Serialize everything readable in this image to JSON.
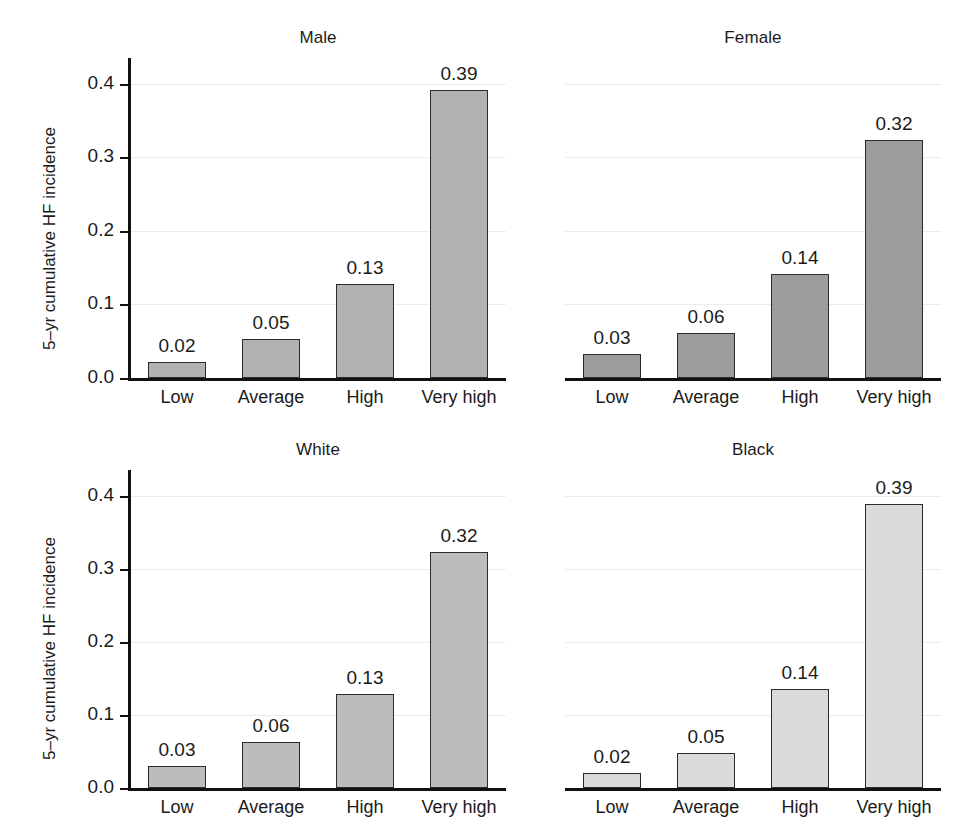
{
  "figure": {
    "width": 979,
    "height": 830,
    "background": "#ffffff",
    "grid_color": "#ececec",
    "axis_color": "#111111",
    "bar_edge_color": "#2b2b2b"
  },
  "chart_data": [
    {
      "type": "bar",
      "title": "Male",
      "panel": "top-left",
      "categories": [
        "Low",
        "Average",
        "High",
        "Very high"
      ],
      "values": [
        0.02,
        0.05,
        0.13,
        0.39
      ],
      "value_labels": [
        "0.02",
        "0.05",
        "0.13",
        "0.39"
      ],
      "bar_values_precise": [
        0.022,
        0.053,
        0.128,
        0.392
      ],
      "xlabel": "",
      "ylabel": "5–yr cumulative HF incidence",
      "ylim": [
        0.0,
        0.435
      ],
      "yticks": [
        0.0,
        0.1,
        0.2,
        0.3,
        0.4
      ],
      "ytick_labels": [
        "0.0",
        "0.1",
        "0.2",
        "0.3",
        "0.4"
      ],
      "grid": true,
      "legend": "none",
      "bar_color": "#b2b2b2",
      "show_yaxis": true
    },
    {
      "type": "bar",
      "title": "Female",
      "panel": "top-right",
      "categories": [
        "Low",
        "Average",
        "High",
        "Very high"
      ],
      "values": [
        0.03,
        0.06,
        0.14,
        0.32
      ],
      "value_labels": [
        "0.03",
        "0.06",
        "0.14",
        "0.32"
      ],
      "bar_values_precise": [
        0.033,
        0.061,
        0.141,
        0.323
      ],
      "xlabel": "",
      "ylabel": "",
      "ylim": [
        0.0,
        0.435
      ],
      "yticks": [
        0.0,
        0.1,
        0.2,
        0.3,
        0.4
      ],
      "ytick_labels": [],
      "grid": true,
      "legend": "none",
      "bar_color": "#9c9c9c",
      "show_yaxis": false
    },
    {
      "type": "bar",
      "title": "White",
      "panel": "bottom-left",
      "categories": [
        "Low",
        "Average",
        "High",
        "Very high"
      ],
      "values": [
        0.03,
        0.06,
        0.13,
        0.32
      ],
      "value_labels": [
        "0.03",
        "0.06",
        "0.13",
        "0.32"
      ],
      "bar_values_precise": [
        0.03,
        0.063,
        0.128,
        0.323
      ],
      "xlabel": "",
      "ylabel": "5–yr cumulative HF incidence",
      "ylim": [
        0.0,
        0.435
      ],
      "yticks": [
        0.0,
        0.1,
        0.2,
        0.3,
        0.4
      ],
      "ytick_labels": [
        "0.0",
        "0.1",
        "0.2",
        "0.3",
        "0.4"
      ],
      "grid": true,
      "legend": "none",
      "bar_color": "#bcbcbc",
      "show_yaxis": true
    },
    {
      "type": "bar",
      "title": "Black",
      "panel": "bottom-right",
      "categories": [
        "Low",
        "Average",
        "High",
        "Very high"
      ],
      "values": [
        0.02,
        0.05,
        0.14,
        0.39
      ],
      "value_labels": [
        "0.02",
        "0.05",
        "0.14",
        "0.39"
      ],
      "bar_values_precise": [
        0.021,
        0.048,
        0.136,
        0.388
      ],
      "xlabel": "",
      "ylabel": "",
      "ylim": [
        0.0,
        0.435
      ],
      "yticks": [
        0.0,
        0.1,
        0.2,
        0.3,
        0.4
      ],
      "ytick_labels": [],
      "grid": true,
      "legend": "none",
      "bar_color": "#dadada",
      "show_yaxis": false
    }
  ]
}
